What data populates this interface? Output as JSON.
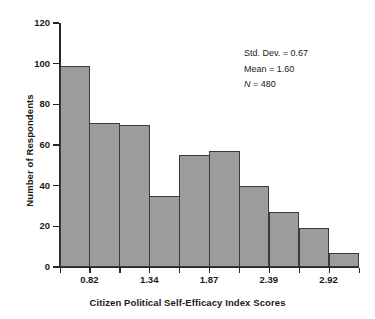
{
  "chart_data": {
    "type": "bar",
    "title": "",
    "subtitle": "",
    "xlabel": "Citizen Political Self-Efficacy Index Scores",
    "ylabel": "Number of Respondents",
    "ylim": [
      0,
      120
    ],
    "ytick_labels": [
      "120",
      "100",
      "80",
      "60",
      "40",
      "20",
      "0"
    ],
    "ytick_values": [
      120,
      100,
      80,
      60,
      40,
      20,
      0
    ],
    "xtick_labels": [
      "0.82",
      "1.34",
      "1.87",
      "2.39",
      "2.92"
    ],
    "xtick_values": [
      0.82,
      1.34,
      1.87,
      2.39,
      2.92
    ],
    "grid": false,
    "legend": "none",
    "bar_count": 10,
    "categories": [
      "bin-1",
      "bin-2",
      "bin-3",
      "bin-4",
      "bin-5",
      "bin-6",
      "bin-7",
      "bin-8",
      "bin-9",
      "bin-10"
    ],
    "values": [
      99,
      71,
      70,
      35,
      55,
      57,
      40,
      27,
      19,
      7
    ],
    "bar_fill_color": "#9c9c9c",
    "bar_edge_color": "#3a3a3a",
    "background_color": "#ffffff",
    "annotations": [
      "Std. Dev. = 0.67",
      "Mean = 1.60",
      "N = 480"
    ]
  },
  "annotation": {
    "std_dev_label": "Std. Dev. = 0.67",
    "mean_label": "Mean = 1.60",
    "n_symbol": "N",
    "n_value": " = 480"
  }
}
